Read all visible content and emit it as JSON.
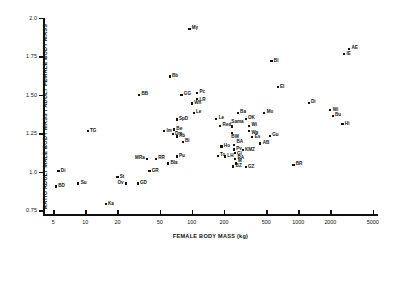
{
  "chart_data": {
    "type": "scatter",
    "title": "",
    "xlabel": "FEMALE BODY MASS (kg)",
    "ylabel": "RATIO ADULT MALE BODY MASS / ADULT FEMALE BODY MASS",
    "xscale": "log",
    "yscale": "linear",
    "xlim": [
      4,
      5600
    ],
    "ylim": [
      0.72,
      2.0
    ],
    "grid": false,
    "legend": "none",
    "xticks": [
      5,
      10,
      20,
      50,
      100,
      200,
      500,
      1000,
      2000,
      5000
    ],
    "xticklabels": [
      "5",
      "10",
      "20",
      "50",
      "100",
      "200",
      "500",
      "1000",
      "2000",
      "5000"
    ],
    "yticks": [
      0.75,
      1.0,
      1.25,
      1.5,
      1.75,
      2.0
    ],
    "yticklabels": [
      "0.75",
      "1.0",
      "1.25",
      "1.50",
      "1.75",
      "2.0"
    ],
    "points": [
      {
        "label": "My",
        "x": 95,
        "y": 1.93,
        "pos": "r"
      },
      {
        "label": "AE",
        "x": 3000,
        "y": 1.8,
        "pos": "r"
      },
      {
        "label": "IE",
        "x": 2700,
        "y": 1.765,
        "pos": "r"
      },
      {
        "label": "Bl",
        "x": 560,
        "y": 1.72,
        "pos": "r"
      },
      {
        "label": "Bb",
        "x": 62,
        "y": 1.62,
        "pos": "r"
      },
      {
        "label": "EI",
        "x": 640,
        "y": 1.55,
        "pos": "r"
      },
      {
        "label": "BB",
        "x": 32,
        "y": 1.5,
        "pos": "r"
      },
      {
        "label": "GG",
        "x": 80,
        "y": 1.5,
        "pos": "r"
      },
      {
        "label": "Pc",
        "x": 112,
        "y": 1.515,
        "pos": "r"
      },
      {
        "label": "LR",
        "x": 112,
        "y": 1.475,
        "pos": "rb"
      },
      {
        "label": "Wh",
        "x": 100,
        "y": 1.445,
        "pos": "r"
      },
      {
        "label": "Di",
        "x": 1250,
        "y": 1.45,
        "pos": "r"
      },
      {
        "label": "Wi",
        "x": 2000,
        "y": 1.4,
        "pos": "r"
      },
      {
        "label": "Le",
        "x": 104,
        "y": 1.385,
        "pos": "r"
      },
      {
        "label": "Ba",
        "x": 270,
        "y": 1.385,
        "pos": "r"
      },
      {
        "label": "Mo",
        "x": 480,
        "y": 1.385,
        "pos": "r"
      },
      {
        "label": "Bu",
        "x": 2100,
        "y": 1.365,
        "pos": "r"
      },
      {
        "label": "SpD",
        "x": 72,
        "y": 1.34,
        "pos": "r"
      },
      {
        "label": "Le",
        "x": 170,
        "y": 1.345,
        "pos": "r"
      },
      {
        "label": "OK",
        "x": 320,
        "y": 1.345,
        "pos": "r"
      },
      {
        "label": "Hi",
        "x": 2600,
        "y": 1.31,
        "pos": "r"
      },
      {
        "label": "Red",
        "x": 185,
        "y": 1.3,
        "pos": "r"
      },
      {
        "label": "Sama",
        "x": 240,
        "y": 1.295,
        "pos": "t"
      },
      {
        "label": "Wi",
        "x": 345,
        "y": 1.3,
        "pos": "r"
      },
      {
        "label": "Wa",
        "x": 345,
        "y": 1.265,
        "pos": "rb"
      },
      {
        "label": "TG",
        "x": 10.5,
        "y": 1.265,
        "pos": "r"
      },
      {
        "label": "Im",
        "x": 55,
        "y": 1.265,
        "pos": "r"
      },
      {
        "label": "Be",
        "x": 68,
        "y": 1.275,
        "pos": "r"
      },
      {
        "label": "Dm",
        "x": 66,
        "y": 1.245,
        "pos": "r"
      },
      {
        "label": "BW",
        "x": 240,
        "y": 1.255,
        "pos": "b"
      },
      {
        "label": "Ab",
        "x": 72,
        "y": 1.23,
        "pos": "r"
      },
      {
        "label": "Gu",
        "x": 540,
        "y": 1.235,
        "pos": "r"
      },
      {
        "label": "Es",
        "x": 370,
        "y": 1.225,
        "pos": "r"
      },
      {
        "label": "Bl",
        "x": 82,
        "y": 1.195,
        "pos": "r"
      },
      {
        "label": "AB",
        "x": 440,
        "y": 1.185,
        "pos": "r"
      },
      {
        "label": "Ho",
        "x": 190,
        "y": 1.165,
        "pos": "r"
      },
      {
        "label": "BA",
        "x": 250,
        "y": 1.175,
        "pos": "rt"
      },
      {
        "label": "Pv",
        "x": 248,
        "y": 1.145,
        "pos": "r"
      },
      {
        "label": "Gl",
        "x": 252,
        "y": 1.125,
        "pos": "rb"
      },
      {
        "label": "KMZ",
        "x": 300,
        "y": 1.14,
        "pos": "r"
      },
      {
        "label": "Pu",
        "x": 72,
        "y": 1.1,
        "pos": "r"
      },
      {
        "label": "To",
        "x": 175,
        "y": 1.105,
        "pos": "r"
      },
      {
        "label": "LH",
        "x": 205,
        "y": 1.1,
        "pos": "r"
      },
      {
        "label": "RA",
        "x": 255,
        "y": 1.085,
        "pos": "r"
      },
      {
        "label": "MRa",
        "x": 38,
        "y": 1.085,
        "pos": "l"
      },
      {
        "label": "RR",
        "x": 46,
        "y": 1.085,
        "pos": "r"
      },
      {
        "label": "Bla",
        "x": 60,
        "y": 1.055,
        "pos": "r"
      },
      {
        "label": "BZ",
        "x": 245,
        "y": 1.035,
        "pos": "r"
      },
      {
        "label": "M",
        "x": 258,
        "y": 1.055,
        "pos": "rt"
      },
      {
        "label": "GZ",
        "x": 320,
        "y": 1.03,
        "pos": "r"
      },
      {
        "label": "BR",
        "x": 900,
        "y": 1.045,
        "pos": "r"
      },
      {
        "label": "Di",
        "x": 5.6,
        "y": 1.005,
        "pos": "r"
      },
      {
        "label": "GR",
        "x": 40,
        "y": 1.005,
        "pos": "r"
      },
      {
        "label": "St",
        "x": 20,
        "y": 0.965,
        "pos": "r"
      },
      {
        "label": "Su",
        "x": 8.6,
        "y": 0.925,
        "pos": "r"
      },
      {
        "label": "GD",
        "x": 31,
        "y": 0.925,
        "pos": "r"
      },
      {
        "label": "Ov",
        "x": 24,
        "y": 0.925,
        "pos": "l"
      },
      {
        "label": "BD",
        "x": 5.3,
        "y": 0.905,
        "pos": "r"
      },
      {
        "label": "Ka",
        "x": 15.5,
        "y": 0.79,
        "pos": "r"
      }
    ]
  }
}
